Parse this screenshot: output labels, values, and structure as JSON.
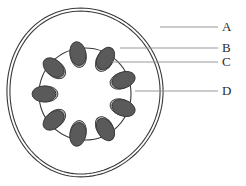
{
  "figure": {
    "type": "biological-cross-section-diagram",
    "background_color": "#ffffff",
    "outline_color": "#3a3a3a",
    "doublet_light_color": "#b7b7b7",
    "doublet_dark_color": "#5a5a5a",
    "leader_line_color": "#8d8d8d",
    "label_text_color": "#2b2b2b"
  },
  "labels": [
    {
      "id": "A",
      "text": "A",
      "points_to": "outer-membrane",
      "leader_y": 27,
      "leader_x_start": 160,
      "leader_x_end": 218
    },
    {
      "id": "B",
      "text": "B",
      "points_to": "doublet-light-subfiber",
      "leader_y": 48,
      "leader_x_start": 120,
      "leader_x_end": 218
    },
    {
      "id": "C",
      "text": "C",
      "points_to": "doublet-dark-subfiber",
      "leader_y": 62,
      "leader_x_start": 112,
      "leader_x_end": 218
    },
    {
      "id": "D",
      "text": "D",
      "points_to": "inner-ring",
      "leader_y": 91,
      "leader_x_start": 135,
      "leader_x_end": 218
    }
  ],
  "shapes": {
    "outer_membrane": {
      "name": "outer-membrane-egg-outline",
      "stroke_count": 2,
      "stroke_width": 1.1,
      "center_x": 85,
      "center_y": 95,
      "radius_x": 78,
      "radius_y": 86,
      "inner_offset": 3
    },
    "inner_ring": {
      "name": "inner-ring-circle",
      "center_x": 85,
      "center_y": 94,
      "radius": 46,
      "stroke_width": 1.1
    },
    "doublets": {
      "name": "microtubule-doublets",
      "count": 9,
      "start_angle_deg": -100,
      "ellipse_rx": 8,
      "ellipse_ry": 12,
      "light_offset": 7,
      "dark_offset": -5
    }
  },
  "counts": {
    "doublet_count": 9,
    "label_count": 4
  }
}
